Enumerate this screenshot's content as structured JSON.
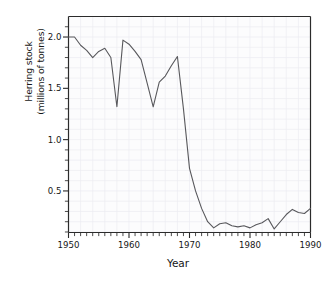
{
  "chart_data": {
    "type": "line",
    "title": "",
    "xlabel": "Year",
    "ylabel": "Herring stock (millions of tonnes)",
    "ylabel_line1": "Herring stock",
    "ylabel_line2": "(millions of tonnes)",
    "xlim": [
      1950,
      1990
    ],
    "ylim": [
      0.095,
      2.2
    ],
    "xticks": [
      1950,
      1960,
      1970,
      1980,
      1990
    ],
    "xtick_labels": [
      "1950",
      "1960",
      "1970",
      "1980",
      "1990"
    ],
    "xminor_step": 1,
    "yticks": [
      0.5,
      1.0,
      1.5,
      2.0
    ],
    "ytick_labels": [
      "0.5",
      "1.0",
      "1.5",
      "2.0"
    ],
    "yminor_step": 0.1,
    "grid": true,
    "grid_color": "#ededf2",
    "legend": "none",
    "line_color": "#58585c",
    "axis_color": "#2b2b2b",
    "plot_background": "#fcfcfd",
    "x": [
      1950,
      1951,
      1952,
      1953,
      1954,
      1955,
      1956,
      1957,
      1958,
      1959,
      1960,
      1961,
      1962,
      1963,
      1964,
      1965,
      1966,
      1967,
      1968,
      1969,
      1970,
      1971,
      1972,
      1973,
      1974,
      1975,
      1976,
      1977,
      1978,
      1979,
      1980,
      1981,
      1982,
      1983,
      1984,
      1985,
      1986,
      1987,
      1988,
      1989,
      1990
    ],
    "values": [
      2.0,
      2.0,
      1.92,
      1.87,
      1.8,
      1.86,
      1.89,
      1.8,
      1.32,
      1.97,
      1.93,
      1.86,
      1.78,
      1.55,
      1.32,
      1.56,
      1.62,
      1.72,
      1.81,
      1.3,
      0.72,
      0.5,
      0.33,
      0.2,
      0.14,
      0.18,
      0.19,
      0.16,
      0.15,
      0.16,
      0.14,
      0.17,
      0.19,
      0.23,
      0.13,
      0.2,
      0.27,
      0.32,
      0.29,
      0.28,
      0.33
    ]
  }
}
